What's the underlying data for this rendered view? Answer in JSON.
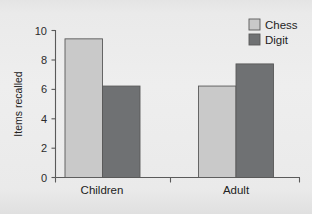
{
  "chart_data": {
    "type": "bar",
    "title": "",
    "subtitle": "",
    "xlabel": "",
    "ylabel": "Items recalled",
    "categories": [
      "Children",
      "Adult"
    ],
    "series": [
      {
        "name": "Chess",
        "values": [
          9.4,
          6.2
        ],
        "color": "#c9c9c9"
      },
      {
        "name": "Digit",
        "values": [
          6.2,
          7.7
        ],
        "color": "#6f7173"
      }
    ],
    "ylim": [
      0,
      10
    ],
    "yticks": [
      0,
      2,
      4,
      6,
      8,
      10
    ],
    "ytick_labels": [
      "0",
      "2",
      "4",
      "6",
      "8",
      "10"
    ],
    "grid": false,
    "legend_position": "top-right"
  },
  "legend": {
    "items": [
      {
        "label": "Chess",
        "color": "#c9c9c9"
      },
      {
        "label": "Digit",
        "color": "#6f7173"
      }
    ]
  },
  "axes": {
    "y_title": "Items recalled",
    "y_tick_labels": [
      "10",
      "8",
      "6",
      "4",
      "2",
      "0"
    ],
    "x_tick_labels": [
      "Children",
      "Adult"
    ]
  },
  "caption": {
    "text": ""
  },
  "colors": {
    "background": "#e9e9e9",
    "axis": "#5a5a5a",
    "bar_light": "#c9c9c9",
    "bar_dark": "#6f7173",
    "text": "#222222"
  }
}
